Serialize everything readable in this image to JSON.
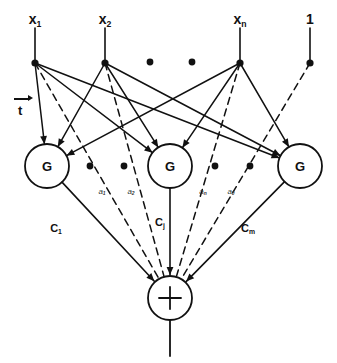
{
  "figure": {
    "type": "rbf-neural-network-diagram",
    "background": "#ffffff",
    "stroke_color": "#111111",
    "width": 337,
    "height": 363
  },
  "inputs": [
    {
      "id": "x1",
      "label": "x",
      "sub": "1",
      "x": 35,
      "y": 63,
      "lead_top": 28
    },
    {
      "id": "x2",
      "label": "x",
      "sub": "2",
      "x": 105,
      "y": 63,
      "lead_top": 28
    },
    {
      "id": "xn",
      "label": "x",
      "sub": "n",
      "x": 240,
      "y": 63,
      "lead_top": 28
    },
    {
      "id": "bias",
      "label": "1",
      "sub": "",
      "x": 310,
      "y": 63,
      "lead_top": 28
    }
  ],
  "input_ellipsis": [
    {
      "x": 150,
      "y": 62
    },
    {
      "x": 192,
      "y": 62
    }
  ],
  "hidden_units": [
    {
      "id": "g1",
      "label": "G",
      "cx": 47,
      "cy": 166,
      "r": 22
    },
    {
      "id": "gj",
      "label": "G",
      "cx": 170,
      "cy": 166,
      "r": 22
    },
    {
      "id": "gm",
      "label": "G",
      "cx": 300,
      "cy": 166,
      "r": 22
    }
  ],
  "hidden_ellipsis": [
    {
      "x": 90,
      "y": 166
    },
    {
      "x": 124,
      "y": 166
    },
    {
      "x": 215,
      "y": 166
    },
    {
      "x": 250,
      "y": 166
    }
  ],
  "output_unit": {
    "id": "sum",
    "label": "+",
    "cx": 170,
    "cy": 298,
    "r": 22,
    "out_line_end_y": 356
  },
  "weight_labels": {
    "t_vector": {
      "label": "t",
      "x": 18,
      "y": 104
    },
    "a_weights": [
      {
        "label": "a",
        "sub": "1",
        "x": 102,
        "y": 192
      },
      {
        "label": "a",
        "sub": "2",
        "x": 131,
        "y": 192
      },
      {
        "label": "a",
        "sub": "n",
        "x": 203,
        "y": 192
      },
      {
        "label": "a",
        "sub": "0",
        "x": 231,
        "y": 192
      }
    ],
    "c_weights": [
      {
        "label": "C",
        "sub": "1",
        "x": 56,
        "y": 228
      },
      {
        "label": "C",
        "sub": "j",
        "x": 160,
        "y": 222
      },
      {
        "label": "C",
        "sub": "m",
        "x": 248,
        "y": 228
      }
    ]
  },
  "edges": {
    "solid_note": "each input node connects by solid lines to every G unit",
    "dashed_note": "each input node connects by dashed line directly to the summation node"
  }
}
